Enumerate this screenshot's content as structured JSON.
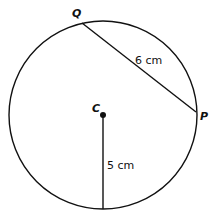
{
  "diagram": {
    "type": "circle-geometry",
    "circle": {
      "center_label": "C",
      "cx": 103,
      "cy": 115,
      "r": 94
    },
    "points": {
      "Q": {
        "label": "Q",
        "x": 82,
        "y": 23
      },
      "P": {
        "label": "P",
        "x": 196,
        "y": 112
      },
      "C": {
        "label": "C",
        "x": 103,
        "y": 115
      }
    },
    "segments": [
      {
        "name": "chord-QP",
        "from": "Q",
        "to": "P",
        "length_label": "6 cm"
      },
      {
        "name": "radius",
        "from": "C",
        "to": "bottom",
        "length_label": "5 cm"
      }
    ],
    "colors": {
      "stroke": "#111111",
      "background": "#ffffff"
    }
  }
}
